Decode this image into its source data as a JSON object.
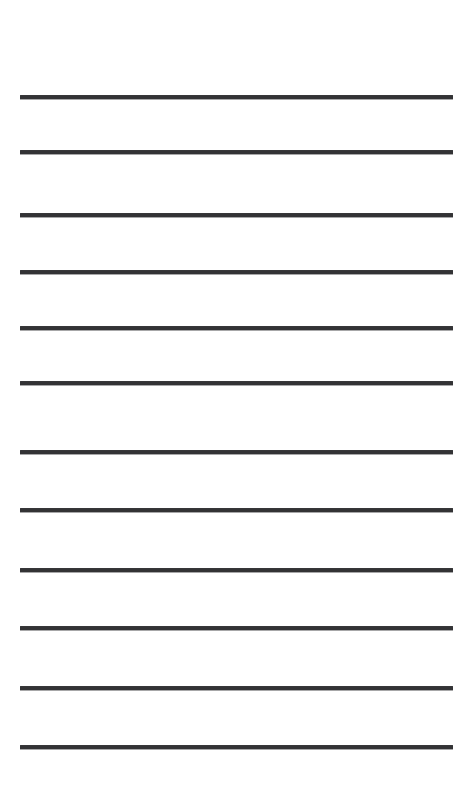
{
  "page": {
    "kind": "blank-lined-writing-sheet",
    "background_color": "#ffffff",
    "width_px": 472,
    "height_px": 787,
    "orientation": "portrait",
    "text_content": ""
  },
  "ruling": {
    "line_color": "#333335",
    "line_count": 12,
    "line_thickness_px": 4,
    "line_start_x_px": 20,
    "line_end_x_px": 453,
    "line_length_px": 433,
    "left_margin_px": 20,
    "right_margin_px": 19,
    "top_margin_px": 97,
    "bottom_margin_px": 40,
    "average_line_spacing_px": 59,
    "has_vertical_margin_rule": false,
    "has_header_text": false,
    "lines": [
      {
        "index": 1,
        "label": "writing-line-1",
        "center_y_px": 97
      },
      {
        "index": 2,
        "label": "writing-line-2",
        "center_y_px": 152
      },
      {
        "index": 3,
        "label": "writing-line-3",
        "center_y_px": 215
      },
      {
        "index": 4,
        "label": "writing-line-4",
        "center_y_px": 272
      },
      {
        "index": 5,
        "label": "writing-line-5",
        "center_y_px": 328
      },
      {
        "index": 6,
        "label": "writing-line-6",
        "center_y_px": 383
      },
      {
        "index": 7,
        "label": "writing-line-7",
        "center_y_px": 452
      },
      {
        "index": 8,
        "label": "writing-line-8",
        "center_y_px": 510
      },
      {
        "index": 9,
        "label": "writing-line-9",
        "center_y_px": 570
      },
      {
        "index": 10,
        "label": "writing-line-10",
        "center_y_px": 628
      },
      {
        "index": 11,
        "label": "writing-line-11",
        "center_y_px": 688
      },
      {
        "index": 12,
        "label": "writing-line-12",
        "center_y_px": 747
      }
    ]
  }
}
